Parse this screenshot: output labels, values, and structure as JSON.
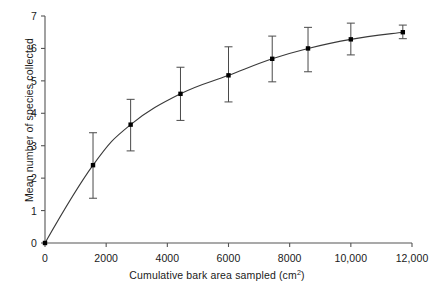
{
  "chart_data": {
    "type": "line",
    "title": "",
    "xlabel": "Cumulative bark area sampled (cm2)",
    "xlabel_text": "Cumulative bark area sampled (cm",
    "xlabel_sup": "2",
    "xlabel_tail": ")",
    "ylabel": "Mean number of species collected",
    "xlim": [
      0,
      12000
    ],
    "ylim": [
      0,
      7
    ],
    "grid": false,
    "legend": null,
    "xticks": [
      0,
      2000,
      4000,
      6000,
      8000,
      10000,
      12000
    ],
    "xtick_labels": [
      "0",
      "2000",
      "4000",
      "6000",
      "8000",
      "10,000",
      "12,000"
    ],
    "yticks": [
      0,
      1,
      2,
      3,
      4,
      5,
      6,
      7
    ],
    "ytick_labels": [
      "0",
      "1",
      "2",
      "3",
      "4",
      "5",
      "6",
      "7"
    ],
    "marker": "filled-square",
    "error_bars": "asymmetric-vertical-with-caps",
    "x": [
      0,
      1570,
      2800,
      4430,
      6000,
      7430,
      8600,
      10000,
      11700
    ],
    "y": [
      0,
      2.4,
      3.65,
      4.6,
      5.17,
      5.68,
      6.0,
      6.28,
      6.5
    ],
    "yerr_low": [
      0,
      1.38,
      2.84,
      3.78,
      4.35,
      4.97,
      5.28,
      5.8,
      6.3
    ],
    "yerr_high": [
      0,
      3.4,
      4.43,
      5.42,
      6.05,
      6.38,
      6.65,
      6.78,
      6.72
    ],
    "series": [
      {
        "name": "Mean species accumulation",
        "points": [
          {
            "x": 0,
            "y": 0,
            "low": 0,
            "high": 0,
            "has_error_bar": false
          },
          {
            "x": 1570,
            "y": 2.4,
            "low": 1.38,
            "high": 3.4,
            "has_error_bar": true
          },
          {
            "x": 2800,
            "y": 3.65,
            "low": 2.84,
            "high": 4.43,
            "has_error_bar": true
          },
          {
            "x": 4430,
            "y": 4.6,
            "low": 3.78,
            "high": 5.42,
            "has_error_bar": true
          },
          {
            "x": 6000,
            "y": 5.17,
            "low": 4.35,
            "high": 6.05,
            "has_error_bar": true
          },
          {
            "x": 7430,
            "y": 5.68,
            "low": 4.97,
            "high": 6.38,
            "has_error_bar": true
          },
          {
            "x": 8600,
            "y": 6.0,
            "low": 5.28,
            "high": 6.65,
            "has_error_bar": true
          },
          {
            "x": 10000,
            "y": 6.28,
            "low": 5.8,
            "high": 6.78,
            "has_error_bar": true
          },
          {
            "x": 11700,
            "y": 6.5,
            "low": 6.3,
            "high": 6.72,
            "has_error_bar": true
          }
        ]
      }
    ],
    "colors": {
      "line": "#3a3a3a",
      "marker": "#000000",
      "error_bar": "#4a4a4a",
      "axis": "#555555",
      "text": "#1a1a1a",
      "background": "#ffffff"
    }
  }
}
